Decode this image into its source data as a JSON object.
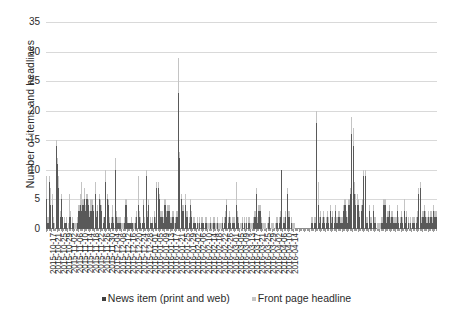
{
  "chart_data": {
    "type": "bar",
    "title": "",
    "subtitle": "",
    "xlabel": "",
    "ylabel": "Number of items and headlines",
    "ylim": [
      0,
      35
    ],
    "yticks": [
      0,
      5,
      10,
      15,
      20,
      25,
      30,
      35
    ],
    "grid": true,
    "legend_position": "bottom",
    "x_tick_label_interval_days": 4,
    "x_start": "2015-10-17",
    "x_end": "2016-04-16",
    "xtick_labels": [
      "2015-10-17",
      "2015-10-21",
      "2015-10-25",
      "2015-10-29",
      "2015-11-02",
      "2015-11-06",
      "2015-11-10",
      "2015-11-14",
      "2015-11-18",
      "2015-11-22",
      "2015-11-26",
      "2015-11-30",
      "2015-12-04",
      "2015-12-08",
      "2015-12-12",
      "2015-12-16",
      "2015-12-20",
      "2015-12-24",
      "2015-12-28",
      "2016-01-01",
      "2016-01-05",
      "2016-01-09",
      "2016-01-13",
      "2016-01-17",
      "2016-01-21",
      "2016-01-25",
      "2016-01-29",
      "2016-02-02",
      "2016-02-06",
      "2016-02-10",
      "2016-02-14",
      "2016-02-18",
      "2016-02-22",
      "2016-02-26",
      "2016-03-01",
      "2016-03-05",
      "2016-03-09",
      "2016-03-13",
      "2016-03-17",
      "2016-03-21",
      "2016-03-25",
      "2016-03-29",
      "2016-04-02",
      "2016-04-06",
      "2016-04-10",
      "2016-04-14"
    ],
    "series": [
      {
        "name": "News item (print and web)",
        "color": "#595959",
        "values": [
          5,
          1,
          8,
          4,
          4,
          1,
          0,
          14,
          11,
          7,
          2,
          5,
          2,
          1,
          1,
          1,
          0,
          2,
          2,
          1,
          1,
          0,
          0,
          1,
          3,
          4,
          3,
          4,
          5,
          3,
          5,
          4,
          2,
          3,
          4,
          3,
          6,
          2,
          3,
          5,
          4,
          3,
          1,
          2,
          8,
          5,
          4,
          1,
          1,
          2,
          1,
          10,
          2,
          1,
          1,
          1,
          0,
          0,
          1,
          4,
          1,
          1,
          1,
          1,
          1,
          0,
          1,
          2,
          4,
          2,
          1,
          1,
          4,
          1,
          9,
          2,
          4,
          1,
          1,
          1,
          2,
          1,
          7,
          7,
          5,
          2,
          2,
          1,
          4,
          2,
          3,
          3,
          1,
          1,
          2,
          0,
          1,
          2,
          23,
          12,
          5,
          3,
          3,
          4,
          2,
          2,
          1,
          4,
          2,
          1,
          1,
          1,
          1,
          0,
          1,
          1,
          1,
          1,
          1,
          1,
          0,
          0,
          1,
          0,
          1,
          1,
          0,
          1,
          0,
          0,
          0,
          1,
          1,
          2,
          4,
          1,
          2,
          1,
          1,
          1,
          1,
          4,
          2,
          1,
          0,
          0,
          1,
          1,
          0,
          1,
          1,
          1,
          0,
          0,
          1,
          2,
          6,
          1,
          3,
          3,
          1,
          0,
          0,
          0,
          0,
          1,
          2,
          0,
          0,
          0,
          0,
          1,
          1,
          1,
          2,
          10,
          1,
          1,
          2,
          6,
          2,
          2,
          1,
          0,
          0,
          0,
          0,
          0,
          0,
          0,
          0,
          0,
          0,
          0,
          0,
          0,
          0,
          1,
          1,
          1,
          1,
          18,
          4,
          1,
          2,
          1,
          2,
          1,
          1,
          2,
          1,
          3,
          1,
          2,
          1,
          3,
          1,
          2,
          2,
          1,
          1,
          3,
          4,
          2,
          1,
          4,
          6,
          16,
          14,
          6,
          4,
          4,
          4,
          2,
          3,
          4,
          9,
          9,
          1,
          1,
          3,
          1,
          1,
          3,
          1,
          1,
          0,
          0,
          0,
          1,
          1,
          4,
          4,
          1,
          2,
          3,
          1,
          2,
          1,
          1,
          1,
          3,
          1,
          1,
          2,
          1,
          3,
          1,
          2,
          1,
          0,
          1,
          1,
          1,
          1,
          1,
          2,
          6,
          7,
          1,
          2,
          3,
          2,
          1,
          2,
          1,
          2,
          1,
          3,
          2,
          2
        ]
      },
      {
        "name": "Front page headline",
        "color": "#c4c4c4",
        "values": [
          9,
          2,
          9,
          7,
          6,
          2,
          1,
          15,
          12,
          9,
          3,
          6,
          2,
          2,
          1,
          2,
          1,
          6,
          3,
          2,
          1,
          1,
          1,
          2,
          4,
          6,
          8,
          5,
          7,
          4,
          6,
          5,
          3,
          5,
          5,
          4,
          8,
          3,
          4,
          6,
          5,
          4,
          2,
          2,
          10,
          6,
          5,
          2,
          2,
          4,
          2,
          12,
          3,
          2,
          2,
          2,
          1,
          1,
          2,
          5,
          2,
          1,
          1,
          2,
          1,
          1,
          2,
          3,
          9,
          3,
          2,
          1,
          5,
          2,
          10,
          3,
          5,
          2,
          1,
          2,
          3,
          2,
          8,
          8,
          6,
          3,
          3,
          2,
          5,
          3,
          4,
          4,
          2,
          2,
          3,
          1,
          2,
          3,
          29,
          13,
          6,
          4,
          4,
          6,
          3,
          3,
          2,
          5,
          3,
          2,
          2,
          1,
          2,
          1,
          2,
          2,
          2,
          1,
          2,
          2,
          1,
          1,
          2,
          1,
          2,
          2,
          1,
          2,
          1,
          1,
          1,
          2,
          2,
          3,
          5,
          2,
          3,
          2,
          2,
          2,
          2,
          8,
          3,
          2,
          1,
          1,
          2,
          2,
          1,
          2,
          2,
          2,
          1,
          1,
          2,
          3,
          7,
          2,
          4,
          4,
          2,
          1,
          1,
          1,
          1,
          2,
          3,
          1,
          1,
          1,
          1,
          2,
          2,
          2,
          3,
          10,
          2,
          2,
          3,
          7,
          3,
          3,
          2,
          1,
          1,
          0,
          0,
          0,
          0,
          0,
          0,
          0,
          0,
          0,
          0,
          0,
          0,
          2,
          2,
          2,
          2,
          20,
          8,
          2,
          3,
          2,
          3,
          2,
          2,
          3,
          2,
          4,
          2,
          3,
          2,
          4,
          2,
          3,
          3,
          2,
          2,
          4,
          5,
          3,
          2,
          5,
          7,
          19,
          17,
          8,
          6,
          6,
          5,
          3,
          4,
          5,
          10,
          10,
          2,
          2,
          4,
          2,
          2,
          4,
          2,
          2,
          1,
          1,
          1,
          2,
          2,
          5,
          5,
          2,
          3,
          4,
          2,
          3,
          2,
          2,
          2,
          4,
          2,
          2,
          3,
          2,
          5,
          2,
          3,
          2,
          1,
          2,
          2,
          2,
          2,
          2,
          3,
          7,
          8,
          2,
          3,
          4,
          3,
          2,
          3,
          2,
          3,
          2,
          4,
          3,
          3
        ]
      }
    ]
  },
  "legend": {
    "items": [
      {
        "label": "News item (print and web)",
        "color": "#595959"
      },
      {
        "label": "Front page headline",
        "color": "#c4c4c4"
      }
    ]
  },
  "axes": {
    "y_title": "Number of items and headlines",
    "y_tick_labels": [
      "0",
      "5",
      "10",
      "15",
      "20",
      "25",
      "30",
      "35"
    ]
  }
}
